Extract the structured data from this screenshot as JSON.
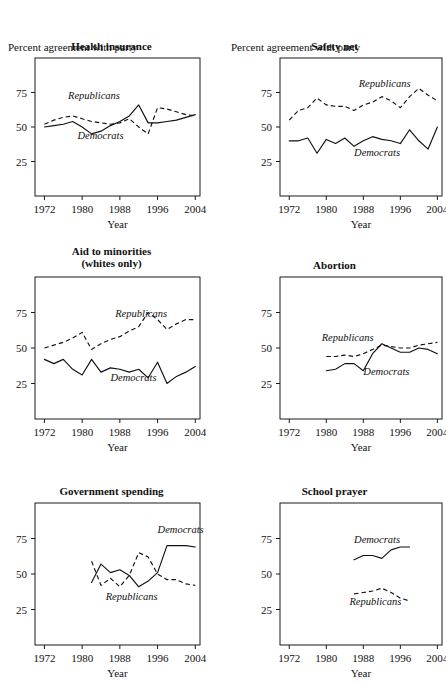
{
  "figure": {
    "axis_xlabel": "Year",
    "subtitle": "Percent agreement with party",
    "xticks": [
      1972,
      1980,
      1988,
      1996,
      2004
    ],
    "yticks": [
      25,
      50,
      75
    ],
    "xlim": [
      1970,
      2005
    ],
    "ylim": [
      0,
      100
    ],
    "series_labels": {
      "republicans": "Republicans",
      "democrats": "Democrats"
    },
    "colors": {
      "ink": "#111111",
      "background": "#ffffff"
    }
  },
  "chart_data": [
    {
      "type": "line",
      "title": "Health insurance",
      "subtitle": "Percent agreement with party",
      "xlabel": "Year",
      "ylabel": "",
      "xlim": [
        1970,
        2005
      ],
      "ylim": [
        0,
        100
      ],
      "grid": false,
      "legend_position": "inline-annotation",
      "series": [
        {
          "name": "Republicans",
          "style": "dashed",
          "x": [
            1972,
            1974,
            1976,
            1978,
            1980,
            1982,
            1984,
            1986,
            1988,
            1990,
            1992,
            1994,
            1996,
            1998,
            2000,
            2002,
            2004
          ],
          "values": [
            52,
            55,
            57,
            58,
            56,
            54,
            53,
            52,
            53,
            56,
            50,
            45,
            64,
            63,
            61,
            59,
            58
          ]
        },
        {
          "name": "Democrats",
          "style": "solid",
          "x": [
            1972,
            1974,
            1976,
            1978,
            1980,
            1982,
            1984,
            1986,
            1988,
            1990,
            1992,
            1994,
            1996,
            1998,
            2000,
            2002,
            2004
          ],
          "values": [
            50,
            51,
            52,
            54,
            50,
            45,
            47,
            51,
            54,
            58,
            66,
            53,
            53,
            54,
            55,
            57,
            59
          ]
        }
      ],
      "annotations": [
        {
          "text": "Republicans",
          "x": 1977,
          "y": 70
        },
        {
          "text": "Democrats",
          "x": 1979,
          "y": 41
        }
      ]
    },
    {
      "type": "line",
      "title": "Safety net",
      "subtitle": "Percent agreement with party",
      "xlabel": "Year",
      "ylabel": "",
      "xlim": [
        1970,
        2005
      ],
      "ylim": [
        0,
        100
      ],
      "grid": false,
      "legend_position": "inline-annotation",
      "series": [
        {
          "name": "Republicans",
          "style": "dashed",
          "x": [
            1972,
            1974,
            1976,
            1978,
            1980,
            1982,
            1984,
            1986,
            1988,
            1990,
            1992,
            1994,
            1996,
            1998,
            2000,
            2002,
            2004
          ],
          "values": [
            55,
            62,
            64,
            71,
            66,
            65,
            65,
            62,
            66,
            68,
            72,
            69,
            64,
            72,
            78,
            73,
            69
          ]
        },
        {
          "name": "Democrats",
          "style": "solid",
          "x": [
            1972,
            1974,
            1976,
            1978,
            1980,
            1982,
            1984,
            1986,
            1988,
            1990,
            1992,
            1994,
            1996,
            1998,
            2000,
            2002,
            2004
          ],
          "values": [
            40,
            40,
            42,
            31,
            41,
            38,
            42,
            36,
            40,
            43,
            41,
            40,
            38,
            48,
            40,
            34,
            50
          ]
        }
      ],
      "annotations": [
        {
          "text": "Republicans",
          "x": 1987,
          "y": 79
        },
        {
          "text": "Democrats",
          "x": 1986,
          "y": 29
        }
      ]
    },
    {
      "type": "line",
      "title": "Aid to minorities",
      "title2": "(whites only)",
      "subtitle": "",
      "xlabel": "Year",
      "ylabel": "",
      "xlim": [
        1970,
        2005
      ],
      "ylim": [
        0,
        100
      ],
      "grid": false,
      "legend_position": "inline-annotation",
      "series": [
        {
          "name": "Republicans",
          "style": "dashed",
          "x": [
            1972,
            1974,
            1976,
            1978,
            1980,
            1982,
            1984,
            1986,
            1988,
            1990,
            1992,
            1994,
            1996,
            1998,
            2000,
            2002,
            2004
          ],
          "values": [
            50,
            52,
            54,
            57,
            61,
            49,
            53,
            56,
            58,
            62,
            65,
            75,
            70,
            63,
            67,
            70,
            70
          ]
        },
        {
          "name": "Democrats",
          "style": "solid",
          "x": [
            1972,
            1974,
            1976,
            1978,
            1980,
            1982,
            1984,
            1986,
            1988,
            1990,
            1992,
            1994,
            1996,
            1998,
            2000,
            2002,
            2004
          ],
          "values": [
            42,
            39,
            42,
            35,
            31,
            42,
            33,
            36,
            35,
            33,
            35,
            29,
            40,
            25,
            30,
            33,
            37
          ]
        }
      ],
      "annotations": [
        {
          "text": "Republicans",
          "x": 1987,
          "y": 72
        },
        {
          "text": "Democrats",
          "x": 1986,
          "y": 27
        }
      ]
    },
    {
      "type": "line",
      "title": "Abortion",
      "subtitle": "",
      "xlabel": "Year",
      "ylabel": "",
      "xlim": [
        1970,
        2005
      ],
      "ylim": [
        0,
        100
      ],
      "grid": false,
      "legend_position": "inline-annotation",
      "series": [
        {
          "name": "Republicans",
          "style": "dashed",
          "x": [
            1980,
            1982,
            1984,
            1986,
            1988,
            1990,
            1992,
            1994,
            1996,
            1998,
            2000,
            2002,
            2004
          ],
          "values": [
            44,
            44,
            45,
            44,
            46,
            49,
            52,
            51,
            50,
            50,
            52,
            53,
            54
          ]
        },
        {
          "name": "Democrats",
          "style": "solid",
          "x": [
            1980,
            1982,
            1984,
            1986,
            1988,
            1990,
            1992,
            1994,
            1996,
            1998,
            2000,
            2002,
            2004
          ],
          "values": [
            34,
            35,
            39,
            39,
            34,
            46,
            53,
            50,
            47,
            47,
            50,
            49,
            46
          ]
        }
      ],
      "annotations": [
        {
          "text": "Republicans",
          "x": 1979,
          "y": 55
        },
        {
          "text": "Democrats",
          "x": 1988,
          "y": 31
        }
      ]
    },
    {
      "type": "line",
      "title": "Government spending",
      "subtitle": "",
      "xlabel": "Year",
      "ylabel": "",
      "xlim": [
        1970,
        2005
      ],
      "ylim": [
        0,
        100
      ],
      "grid": false,
      "legend_position": "inline-annotation",
      "series": [
        {
          "name": "Republicans",
          "style": "dashed",
          "x": [
            1982,
            1984,
            1986,
            1988,
            1990,
            1992,
            1994,
            1996,
            1998,
            2000,
            2002,
            2004
          ],
          "values": [
            59,
            42,
            47,
            41,
            49,
            65,
            62,
            50,
            46,
            46,
            43,
            42
          ]
        },
        {
          "name": "Democrats",
          "style": "solid",
          "x": [
            1982,
            1984,
            1986,
            1988,
            1990,
            1992,
            1994,
            1996,
            1998,
            2000,
            2002,
            2004
          ],
          "values": [
            44,
            57,
            51,
            53,
            49,
            41,
            45,
            51,
            70,
            70,
            70,
            69
          ]
        }
      ],
      "annotations": [
        {
          "text": "Democrats",
          "x": 1996,
          "y": 79
        },
        {
          "text": "Republicans",
          "x": 1985,
          "y": 32
        }
      ]
    },
    {
      "type": "line",
      "title": "School prayer",
      "subtitle": "",
      "xlabel": "Year",
      "ylabel": "",
      "xlim": [
        1970,
        2005
      ],
      "ylim": [
        0,
        100
      ],
      "grid": false,
      "legend_position": "inline-annotation",
      "series": [
        {
          "name": "Republicans",
          "style": "dashed",
          "x": [
            1986,
            1988,
            1990,
            1992,
            1994,
            1996,
            1998
          ],
          "values": [
            36,
            37,
            38,
            40,
            37,
            33,
            31
          ]
        },
        {
          "name": "Democrats",
          "style": "solid",
          "x": [
            1986,
            1988,
            1990,
            1992,
            1994,
            1996,
            1998
          ],
          "values": [
            60,
            63,
            63,
            61,
            67,
            69,
            69
          ]
        }
      ],
      "annotations": [
        {
          "text": "Democrats",
          "x": 1986,
          "y": 72
        },
        {
          "text": "Republicans",
          "x": 1985,
          "y": 28
        }
      ]
    }
  ]
}
